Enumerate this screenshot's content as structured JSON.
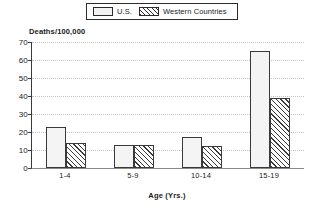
{
  "legend": {
    "items": [
      {
        "label": "U.S.",
        "pattern": "dotted",
        "swatch_name": "legend-swatch-us"
      },
      {
        "label": "Western Countries",
        "pattern": "diagonal-hatch",
        "swatch_name": "legend-swatch-western"
      }
    ]
  },
  "chart_data": {
    "type": "bar",
    "title": "",
    "ylabel": "Deaths/100,000",
    "xlabel": "Age (Yrs.)",
    "categories": [
      "1-4",
      "5-9",
      "10-14",
      "15-19"
    ],
    "series": [
      {
        "name": "U.S.",
        "values": [
          23,
          13,
          17,
          65
        ]
      },
      {
        "name": "Western Countries",
        "values": [
          14,
          13,
          12,
          39
        ]
      }
    ],
    "ylim": [
      0,
      70
    ],
    "yticks": [
      0,
      10,
      20,
      30,
      40,
      50,
      60,
      70
    ],
    "ytick_labels": [
      "0",
      "10",
      "20",
      "30",
      "40",
      "50",
      "60",
      "70"
    ],
    "grid": true,
    "grid_axis": "y",
    "legend_position": "top-center",
    "colors": {
      "axis": "#3a3a3a",
      "grid": "#c4c4c4",
      "bar_outline": "#3a3a3a",
      "background": "#ffffff"
    }
  }
}
